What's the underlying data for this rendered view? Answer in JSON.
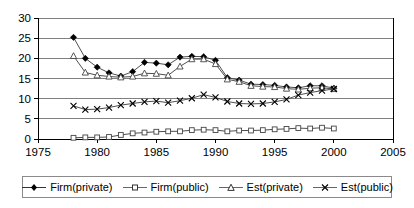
{
  "chart_data": {
    "type": "line",
    "title": "",
    "xlabel": "",
    "ylabel": "",
    "xlim": [
      1975,
      2005
    ],
    "ylim": [
      0,
      30
    ],
    "xticks": [
      1975,
      1980,
      1985,
      1990,
      1995,
      2000,
      2005
    ],
    "yticks": [
      0,
      5,
      10,
      15,
      20,
      25,
      30
    ],
    "grid": "horizontal",
    "legend_position": "bottom",
    "x": [
      1978,
      1979,
      1980,
      1981,
      1982,
      1983,
      1984,
      1985,
      1986,
      1987,
      1988,
      1989,
      1990,
      1991,
      1992,
      1993,
      1994,
      1995,
      1996,
      1997,
      1998,
      1999,
      2000
    ],
    "series": [
      {
        "name": "Firm(private)",
        "marker": "filled-diamond",
        "values": [
          25.2,
          20.0,
          17.8,
          16.4,
          15.6,
          16.7,
          19.0,
          18.8,
          18.4,
          20.3,
          20.5,
          20.4,
          19.5,
          15.2,
          14.6,
          13.6,
          13.5,
          13.3,
          12.9,
          12.7,
          13.2,
          13.2,
          12.6
        ]
      },
      {
        "name": "Firm(public)",
        "marker": "open-square",
        "values": [
          0.3,
          0.4,
          0.4,
          0.5,
          1.0,
          1.4,
          1.6,
          1.8,
          1.9,
          1.9,
          2.2,
          2.3,
          2.2,
          1.9,
          2.1,
          2.1,
          2.2,
          2.4,
          2.5,
          2.7,
          2.6,
          2.8,
          2.6
        ]
      },
      {
        "name": "Est(private)",
        "marker": "open-triangle",
        "values": [
          20.6,
          16.5,
          15.8,
          15.5,
          15.3,
          15.5,
          16.3,
          16.2,
          15.8,
          18.0,
          19.8,
          19.8,
          18.6,
          14.8,
          14.2,
          13.2,
          13.0,
          12.9,
          12.5,
          12.3,
          12.6,
          12.7,
          12.4
        ]
      },
      {
        "name": "Est(public)",
        "marker": "cross-x",
        "values": [
          8.2,
          7.3,
          7.4,
          7.8,
          8.4,
          8.8,
          9.2,
          9.4,
          9.0,
          9.5,
          10.1,
          11.0,
          10.3,
          9.3,
          8.8,
          8.7,
          8.8,
          9.2,
          9.8,
          10.9,
          11.5,
          12.0,
          12.4
        ]
      }
    ]
  },
  "legend": {
    "items": [
      {
        "label": "Firm(private)"
      },
      {
        "label": "Firm(public)"
      },
      {
        "label": "Est(private)"
      },
      {
        "label": "Est(public)"
      }
    ]
  }
}
